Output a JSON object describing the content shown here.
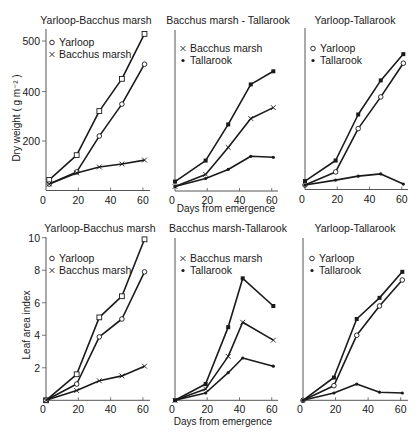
{
  "figure": {
    "xlabel": "Days from emergence",
    "colors": {
      "ink": "#1a1a1a",
      "axis": "#555555",
      "background": "#ffffff"
    }
  },
  "chart_data": [
    {
      "type": "line",
      "panel": "top-left",
      "title": "Yarloop-Bacchus marsh",
      "ylabel": "Dry weight ( g m⁻² )",
      "xlabel": "",
      "xticks": [
        0,
        20,
        40,
        60
      ],
      "yticks": [
        200,
        400,
        500
      ],
      "ylim": [
        0,
        540
      ],
      "legend": [
        {
          "label": "Yarloop",
          "marker": "circle"
        },
        {
          "label": "Bacchus marsh",
          "marker": "cross"
        }
      ],
      "series": [
        {
          "name": "Yarloop (square)",
          "marker": "square",
          "x": [
            2,
            19,
            33,
            47,
            61
          ],
          "values": [
            43,
            143,
            321,
            425,
            514
          ]
        },
        {
          "name": "Yarloop",
          "marker": "circle",
          "x": [
            2,
            19,
            33,
            47,
            61
          ],
          "values": [
            26,
            75,
            220,
            349,
            454
          ]
        },
        {
          "name": "Bacchus marsh",
          "marker": "cross",
          "x": [
            2,
            19,
            33,
            47,
            61
          ],
          "values": [
            26,
            71,
            95,
            107,
            123
          ]
        }
      ]
    },
    {
      "type": "line",
      "panel": "top-middle",
      "title": "Bacchus marsh - Tallarook",
      "ylabel": "",
      "xlabel": "Days from emergence",
      "xticks": [
        0,
        20,
        40,
        60
      ],
      "yticks": [],
      "ylim": [
        0,
        540
      ],
      "legend": [
        {
          "label": "Bacchus marsh",
          "marker": "cross"
        },
        {
          "label": "Tallarook",
          "marker": "dot"
        }
      ],
      "series": [
        {
          "name": "Tallarook (upper)",
          "marker": "dotsquare",
          "x": [
            0,
            19,
            33,
            47,
            61
          ],
          "values": [
            38,
            123,
            269,
            415,
            441
          ]
        },
        {
          "name": "Bacchus marsh",
          "marker": "cross",
          "x": [
            0,
            19,
            33,
            47,
            61
          ],
          "values": [
            18,
            67,
            176,
            293,
            337
          ]
        },
        {
          "name": "Tallarook",
          "marker": "dot",
          "x": [
            0,
            19,
            33,
            47,
            61
          ],
          "values": [
            18,
            51,
            87,
            140,
            136
          ]
        }
      ]
    },
    {
      "type": "line",
      "panel": "top-right",
      "title": "Yarloop-Tallarook",
      "ylabel": "",
      "xlabel": "",
      "xticks": [
        0,
        20,
        40,
        60
      ],
      "yticks": [],
      "ylim": [
        0,
        540
      ],
      "legend": [
        {
          "label": "Yarloop",
          "marker": "circle"
        },
        {
          "label": "Tallarook",
          "marker": "dot"
        }
      ],
      "series": [
        {
          "name": "Tallarook (upper)",
          "marker": "dotsquare",
          "x": [
            0,
            19,
            33,
            47,
            61
          ],
          "values": [
            34,
            117,
            303,
            420,
            472
          ]
        },
        {
          "name": "Yarloop",
          "marker": "circle",
          "x": [
            0,
            19,
            33,
            47,
            61
          ],
          "values": [
            18,
            71,
            246,
            374,
            454
          ]
        },
        {
          "name": "Tallarook",
          "marker": "dot",
          "x": [
            0,
            19,
            33,
            47,
            61
          ],
          "values": [
            18,
            38,
            54,
            63,
            22
          ]
        }
      ]
    },
    {
      "type": "line",
      "panel": "bottom-left",
      "title": "Yarloop-Bacchus marsh",
      "ylabel": "Leaf area index",
      "xlabel": "",
      "xticks": [
        0,
        20,
        40,
        60
      ],
      "yticks": [
        2,
        4,
        6,
        8,
        10
      ],
      "ylim": [
        0,
        10
      ],
      "legend": [
        {
          "label": "Yarloop",
          "marker": "circle"
        },
        {
          "label": "Bacchus marsh",
          "marker": "cross"
        }
      ],
      "series": [
        {
          "name": "Yarloop (square)",
          "marker": "square",
          "x": [
            0,
            19,
            33,
            47,
            61
          ],
          "values": [
            0,
            1.6,
            5.1,
            6.4,
            9.9
          ]
        },
        {
          "name": "Yarloop",
          "marker": "circle",
          "x": [
            0,
            19,
            33,
            47,
            61
          ],
          "values": [
            0,
            1.0,
            3.9,
            5.0,
            7.9
          ]
        },
        {
          "name": "Bacchus marsh",
          "marker": "cross",
          "x": [
            0,
            19,
            33,
            47,
            61
          ],
          "values": [
            0,
            0.6,
            1.2,
            1.5,
            2.1
          ]
        }
      ]
    },
    {
      "type": "line",
      "panel": "bottom-middle",
      "title": "Bacchus marsh-Tallarook",
      "ylabel": "",
      "xlabel": "Days from emergence",
      "xticks": [
        0,
        20,
        40,
        60
      ],
      "yticks": [],
      "ylim": [
        0,
        10
      ],
      "legend": [
        {
          "label": "Bacchus marsh",
          "marker": "cross"
        },
        {
          "label": "Tallarook",
          "marker": "dot"
        }
      ],
      "series": [
        {
          "name": "Tallarook (upper)",
          "marker": "dotsquare",
          "x": [
            0,
            19,
            33,
            42,
            61
          ],
          "values": [
            0,
            1.0,
            4.5,
            7.5,
            5.8
          ]
        },
        {
          "name": "Bacchus marsh",
          "marker": "cross",
          "x": [
            0,
            19,
            33,
            42,
            61
          ],
          "values": [
            0,
            0.7,
            2.7,
            4.8,
            3.7
          ]
        },
        {
          "name": "Tallarook",
          "marker": "dot",
          "x": [
            0,
            19,
            33,
            42,
            61
          ],
          "values": [
            0,
            0.45,
            1.7,
            2.6,
            2.1
          ]
        }
      ]
    },
    {
      "type": "line",
      "panel": "bottom-right",
      "title": "Yarloop-Tallarook",
      "ylabel": "",
      "xlabel": "",
      "xticks": [
        0,
        20,
        40,
        60
      ],
      "yticks": [],
      "ylim": [
        0,
        10
      ],
      "legend": [
        {
          "label": "Yarloop",
          "marker": "circle"
        },
        {
          "label": "Tallarook",
          "marker": "dot"
        }
      ],
      "series": [
        {
          "name": "Tallarook (upper)",
          "marker": "dotsquare",
          "x": [
            0,
            19,
            33,
            47,
            61
          ],
          "values": [
            0,
            1.4,
            5.0,
            6.3,
            7.9
          ]
        },
        {
          "name": "Yarloop",
          "marker": "circle",
          "x": [
            0,
            19,
            33,
            47,
            61
          ],
          "values": [
            0,
            0.9,
            4.0,
            5.8,
            7.4
          ]
        },
        {
          "name": "Tallarook",
          "marker": "dot",
          "x": [
            0,
            19,
            33,
            47,
            61
          ],
          "values": [
            0,
            0.45,
            1.0,
            0.5,
            0.45
          ]
        }
      ]
    }
  ]
}
